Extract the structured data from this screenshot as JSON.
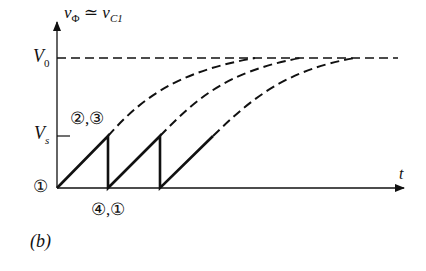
{
  "figure": {
    "panel_label": "(b)",
    "y_axis_label": "vΦ ≃ vC1",
    "y_axis_label_parts": {
      "var": "v",
      "sub": "Φ",
      "approx": "≃",
      "var2": "v",
      "sub2": "C1"
    },
    "x_axis_label": "t",
    "levels": {
      "V0": "V",
      "V0_sub": "0",
      "Vs": "V",
      "Vs_sub": "s"
    },
    "state_labels": {
      "origin": "①",
      "peak": "②,③",
      "reset": "④,①"
    }
  },
  "diagram": {
    "type": "sawtooth charging waveform",
    "ramps": [
      {
        "start_x": 57,
        "peak_x": 108
      },
      {
        "start_x": 108,
        "peak_x": 160
      },
      {
        "start_x": 160,
        "peak_x": 213
      }
    ],
    "asymptote": "V0",
    "colors": {
      "stroke": "#111111",
      "background": "#ffffff"
    }
  }
}
